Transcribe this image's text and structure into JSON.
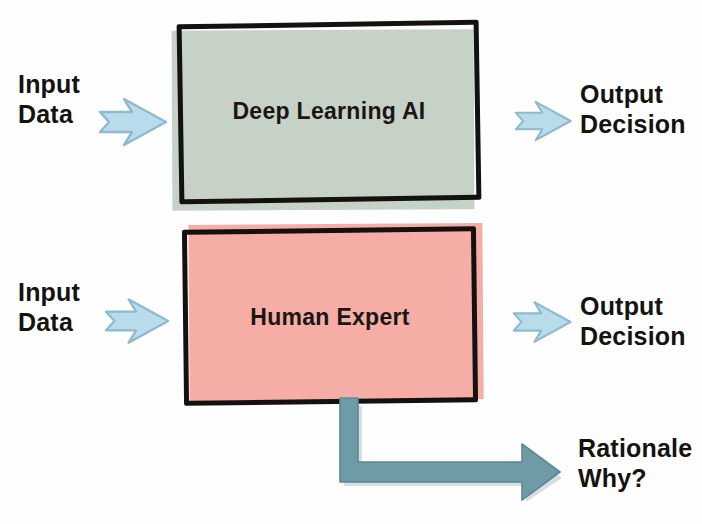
{
  "diagram": {
    "background_color": "#fefefe",
    "ink_color": "#141210",
    "rows": [
      {
        "id": "deep-learning",
        "input_label": "Input\nData",
        "box_label": "Deep Learning AI",
        "box_fill_color": "#c7d2c7",
        "output_label": "Output\nDecision",
        "arrow_color": "#b8dcea",
        "has_rationale": false
      },
      {
        "id": "human-expert",
        "input_label": "Input\nData",
        "box_label": "Human Expert",
        "box_fill_color": "#f5ada5",
        "output_label": "Output\nDecision",
        "arrow_color": "#b8dcea",
        "has_rationale": true
      }
    ],
    "rationale": {
      "label": "Rationale\nWhy?",
      "arrow_color": "#6f9ba6",
      "arrow_shape": "elbow-down-then-right"
    }
  }
}
